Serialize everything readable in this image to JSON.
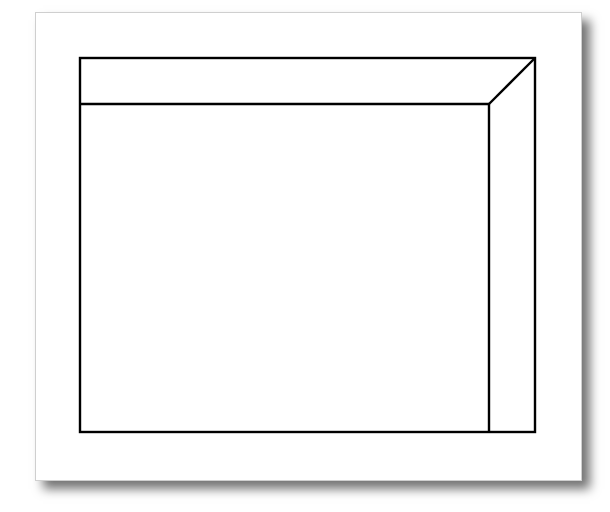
{
  "diagram": {
    "stroke_color": "#000000",
    "card_background": "#ffffff",
    "outer_box": {
      "x": 80,
      "y": 58,
      "width": 455,
      "height": 374
    },
    "top_band_bottom_y": 104,
    "right_band_left_x": 489,
    "miter_line": {
      "x1": 489,
      "y1": 104,
      "x2": 535,
      "y2": 58
    }
  }
}
